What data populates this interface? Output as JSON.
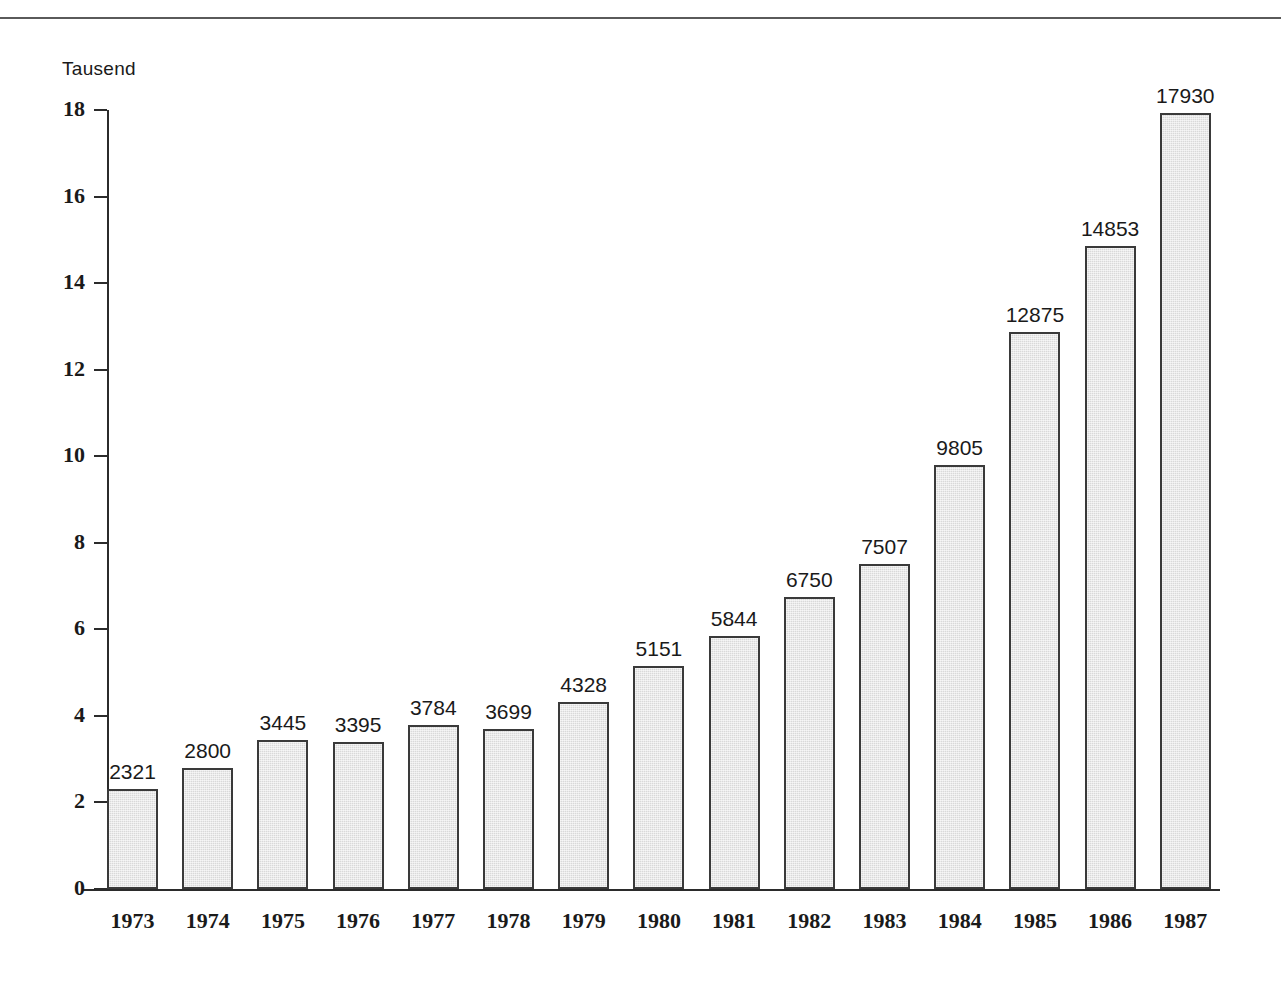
{
  "figure": {
    "unit_caption": "Tausend",
    "has_top_rule": true,
    "background_color": "#ffffff",
    "axis_color": "#2b2b2b",
    "bar_fill_color": "#d9d9d9",
    "bar_border_color": "#3a3a3a",
    "text_color": "#1a1a1a"
  },
  "chart_data": {
    "type": "bar",
    "title": "",
    "subtitle": "",
    "xlabel": "",
    "ylabel": "Tausend",
    "categories": [
      "1973",
      "1974",
      "1975",
      "1976",
      "1977",
      "1978",
      "1979",
      "1980",
      "1981",
      "1982",
      "1983",
      "1984",
      "1985",
      "1986",
      "1987"
    ],
    "values": [
      2321,
      2800,
      3445,
      3395,
      3784,
      3699,
      4328,
      5151,
      5844,
      6750,
      7507,
      9805,
      12875,
      14853,
      17930
    ],
    "value_labels": [
      "2321",
      "2800",
      "3445",
      "3395",
      "3784",
      "3699",
      "4328",
      "5151",
      "5844",
      "6750",
      "7507",
      "9805",
      "12875",
      "14853",
      "17930"
    ],
    "value_scale": 1000,
    "value_unit": "Tausend",
    "ylim": [
      0,
      18
    ],
    "yticks": [
      0,
      2,
      4,
      6,
      8,
      10,
      12,
      14,
      16,
      18
    ],
    "ytick_labels": [
      "0",
      "2",
      "4",
      "6",
      "8",
      "10",
      "12",
      "14",
      "16",
      "18"
    ],
    "grid": false,
    "legend": null,
    "legend_position": "none",
    "data_labels_shown": true,
    "annotations": []
  }
}
